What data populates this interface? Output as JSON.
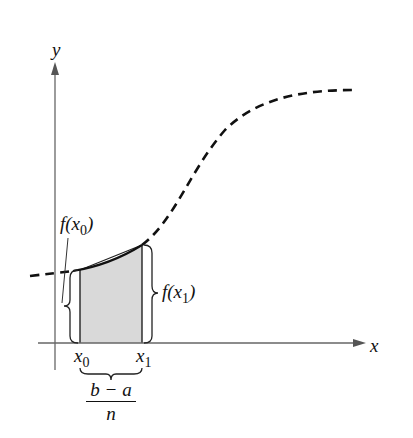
{
  "figure": {
    "type": "trapezoid-rule illustration",
    "axes": {
      "x_label": "x",
      "y_label": "y"
    },
    "curve": {
      "style": "dashed",
      "description": "increasing S-shaped function y = f(x)"
    },
    "region": {
      "style": "shaded trapezoid",
      "fill": "#d9d9d9",
      "left": "x0",
      "right": "x1"
    },
    "labels": {
      "f_x0_fn": "f(x",
      "f_x0_sub": "0",
      "f_x0_close": ")",
      "f_x1_fn": "f(x",
      "f_x1_sub": "1",
      "f_x1_close": ")",
      "x0_var": "x",
      "x0_sub": "0",
      "x1_var": "x",
      "x1_sub": "1",
      "width_numerator": "b − a",
      "width_denominator": "n"
    },
    "colors": {
      "ink": "#111111",
      "axis": "#555555",
      "shade": "#d9d9d9"
    }
  }
}
